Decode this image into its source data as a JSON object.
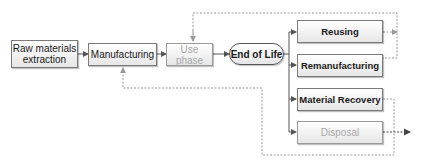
{
  "diagram": {
    "nodes": {
      "raw_materials": "Raw materials extraction",
      "manufacturing": "Manufacturing",
      "use_phase": "Use phase",
      "end_of_life": "End of Life",
      "reusing": "Reusing",
      "remanufacturing": "Remanufacturing",
      "material_recovery": "Material Recovery",
      "disposal": "Disposal"
    },
    "flows": [
      {
        "from": "Raw materials extraction",
        "to": "Manufacturing",
        "style": "solid"
      },
      {
        "from": "Manufacturing",
        "to": "Use phase",
        "style": "solid"
      },
      {
        "from": "Use phase",
        "to": "End of Life",
        "style": "solid"
      },
      {
        "from": "End of Life",
        "to": "Reusing",
        "style": "solid"
      },
      {
        "from": "End of Life",
        "to": "Remanufacturing",
        "style": "solid"
      },
      {
        "from": "End of Life",
        "to": "Material Recovery",
        "style": "solid"
      },
      {
        "from": "End of Life",
        "to": "Disposal",
        "style": "solid"
      },
      {
        "from": "Reusing",
        "to": "Use phase",
        "style": "dotted"
      },
      {
        "from": "Remanufacturing",
        "to": "Use phase",
        "style": "dotted"
      },
      {
        "from": "Material Recovery",
        "to": "Manufacturing",
        "style": "dotted"
      },
      {
        "from": "Disposal",
        "to": "outside",
        "style": "dotted"
      }
    ],
    "colors": {
      "box_border": "#7a7a7a",
      "faded_text": "#a8a8a8",
      "solid_line": "#555555",
      "dotted_line": "#9a9a9a"
    }
  }
}
